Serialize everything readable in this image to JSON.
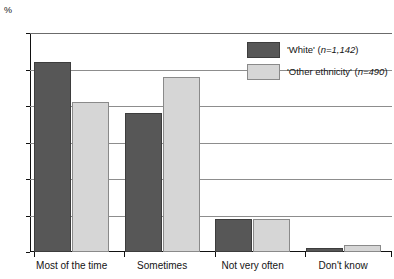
{
  "chart_data": {
    "type": "bar",
    "title": "",
    "xlabel": "",
    "ylabel": "%",
    "ylim": [
      0,
      60
    ],
    "yticks": [
      0,
      10,
      20,
      30,
      40,
      50,
      60
    ],
    "grid": true,
    "legend_position": "top-right",
    "categories": [
      "Most of the time",
      "Sometimes",
      "Not very often",
      "Don't know"
    ],
    "series": [
      {
        "name": "'White' (n=1,142)",
        "short_name": "'White'",
        "sample_size": "n=1,142",
        "color": "#575757",
        "values": [
          52,
          38,
          9,
          1
        ]
      },
      {
        "name": "'Other ethnicity' (n=490)",
        "short_name": "'Other ethnicity'",
        "sample_size": "n=490",
        "color": "#d6d6d6",
        "values": [
          41,
          48,
          9,
          2
        ]
      }
    ]
  },
  "axis": {
    "unit_label": "%",
    "tick_labels": [
      "0",
      "10",
      "20",
      "30",
      "40",
      "50",
      "60"
    ]
  },
  "legend": {
    "items": [
      {
        "label": "'White' (n=1,142)",
        "swatch": "dark-gray"
      },
      {
        "label": "'Other ethnicity' (n=490)",
        "swatch": "light-gray"
      }
    ]
  },
  "colors": {
    "series_white": "#575757",
    "series_other": "#d6d6d6",
    "grid": "#8d8d8d",
    "axis": "#111111",
    "text": "#141414"
  }
}
